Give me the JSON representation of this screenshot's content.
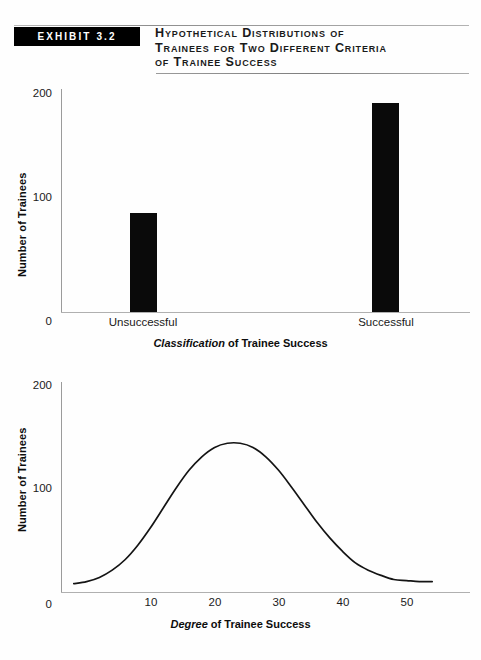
{
  "exhibit": {
    "badge_label": "EXHIBIT 3.2",
    "title_lines": [
      "Hypothetical Distributions of",
      "Trainees for Two Different Criteria",
      "of Trainee Success"
    ]
  },
  "chart_data": [
    {
      "type": "bar",
      "title": "",
      "categories": [
        "Unsuccessful",
        "Successful"
      ],
      "values": [
        88,
        190
      ],
      "xlabel_emphasis": "Classification",
      "xlabel_rest": " of Trainee Success",
      "ylabel": "Number of Trainees",
      "yticks": [
        "0",
        "100",
        "200"
      ],
      "ylim": [
        0,
        200
      ],
      "grid": false,
      "legend": "none"
    },
    {
      "type": "line",
      "title": "",
      "xlabel_emphasis": "Degree",
      "xlabel_rest": " of Trainee Success",
      "ylabel": "Number of Trainees",
      "yticks": [
        "0",
        "100",
        "200"
      ],
      "xticks": [
        "10",
        "20",
        "30",
        "40",
        "50"
      ],
      "ylim": [
        0,
        200
      ],
      "xlim": [
        0,
        58
      ],
      "grid": false,
      "legend": "none",
      "distribution": "normal",
      "peak_x": 28,
      "peak_y": 143,
      "points": [
        {
          "x": 2,
          "y": 8
        },
        {
          "x": 4,
          "y": 10
        },
        {
          "x": 6,
          "y": 14
        },
        {
          "x": 8,
          "y": 21
        },
        {
          "x": 10,
          "y": 31
        },
        {
          "x": 12,
          "y": 45
        },
        {
          "x": 14,
          "y": 62
        },
        {
          "x": 16,
          "y": 81
        },
        {
          "x": 18,
          "y": 100
        },
        {
          "x": 20,
          "y": 117
        },
        {
          "x": 22,
          "y": 130
        },
        {
          "x": 24,
          "y": 139
        },
        {
          "x": 26,
          "y": 143
        },
        {
          "x": 28,
          "y": 143
        },
        {
          "x": 30,
          "y": 139
        },
        {
          "x": 32,
          "y": 130
        },
        {
          "x": 34,
          "y": 117
        },
        {
          "x": 36,
          "y": 101
        },
        {
          "x": 38,
          "y": 84
        },
        {
          "x": 40,
          "y": 67
        },
        {
          "x": 42,
          "y": 52
        },
        {
          "x": 44,
          "y": 39
        },
        {
          "x": 46,
          "y": 28
        },
        {
          "x": 48,
          "y": 21
        },
        {
          "x": 50,
          "y": 16
        },
        {
          "x": 52,
          "y": 12
        },
        {
          "x": 54,
          "y": 11
        },
        {
          "x": 56,
          "y": 10
        },
        {
          "x": 58,
          "y": 10
        }
      ]
    }
  ]
}
